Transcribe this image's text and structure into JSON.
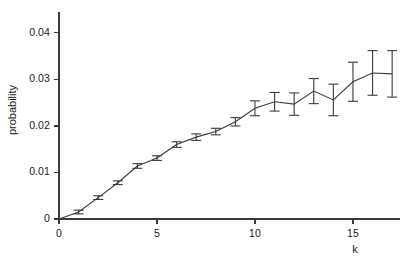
{
  "chart_data": {
    "type": "line",
    "title": "",
    "subtitle": "",
    "xlabel": "k",
    "ylabel": "probability",
    "xlim": [
      0,
      17.4
    ],
    "ylim": [
      0,
      0.0445
    ],
    "grid": false,
    "legend": null,
    "x": [
      0,
      1,
      2,
      3,
      4,
      5,
      6,
      7,
      8,
      9,
      10,
      11,
      12,
      13,
      14,
      15,
      16,
      17
    ],
    "series": [
      {
        "name": "probability",
        "values": [
          0.0,
          0.0015,
          0.0046,
          0.0078,
          0.0114,
          0.0131,
          0.016,
          0.0176,
          0.0188,
          0.0209,
          0.0238,
          0.0252,
          0.0247,
          0.0275,
          0.0256,
          0.0295,
          0.0314,
          0.0312
        ],
        "errors": [
          0.0,
          0.0004,
          0.0004,
          0.0004,
          0.0005,
          0.0005,
          0.0006,
          0.0007,
          0.0007,
          0.0009,
          0.0016,
          0.002,
          0.0024,
          0.0027,
          0.0034,
          0.0042,
          0.0048,
          0.005
        ]
      }
    ],
    "xticks": [
      0,
      5,
      10,
      15
    ],
    "xtick_labels": [
      "0",
      "5",
      "10",
      "15"
    ],
    "yticks": [
      0,
      0.01,
      0.02,
      0.03,
      0.04
    ],
    "ytick_labels": [
      "0",
      "0.01",
      "0.02",
      "0.03",
      "0.04"
    ],
    "line_color": "#3a3a3a",
    "axis_color": "#3a3a3a",
    "error_bar_color": "#3a3a3a"
  }
}
